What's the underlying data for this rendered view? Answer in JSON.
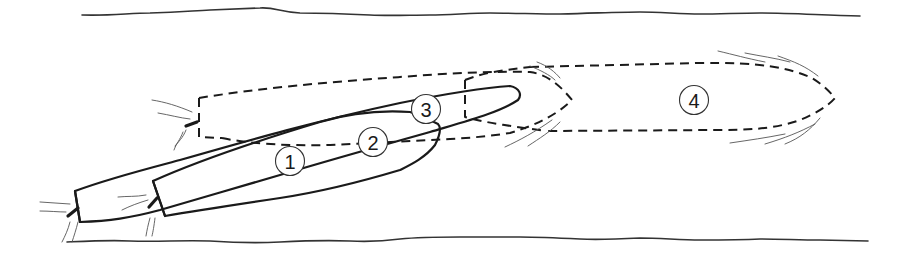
{
  "diagram": {
    "colors": {
      "line": "#1a1a1a",
      "background": "#ffffff"
    },
    "positions": [
      {
        "id": "1",
        "label": "1",
        "style": "solid"
      },
      {
        "id": "2",
        "label": "2",
        "style": "solid"
      },
      {
        "id": "3",
        "label": "3",
        "style": "dashed"
      },
      {
        "id": "4",
        "label": "4",
        "style": "dashed"
      }
    ]
  }
}
